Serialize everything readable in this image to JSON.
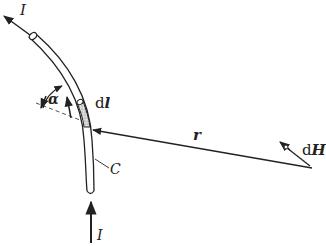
{
  "diagram": {
    "labels": {
      "current_top": "I",
      "current_bottom": "I",
      "alpha": "α",
      "dl_prefix": "d",
      "dl_symbol": "l",
      "r": "r",
      "dH_prefix": "d",
      "dH_symbol": "H",
      "curve": "C"
    },
    "colors": {
      "ink": "#222222",
      "background": "#ffffff",
      "hatch": "#bbbbbb"
    }
  }
}
